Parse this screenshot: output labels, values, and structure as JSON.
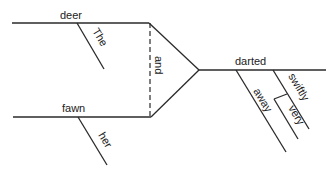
{
  "diagram": {
    "type": "sentence-diagram",
    "sentence_words": {
      "subject_1": "deer",
      "subject_1_modifier": "The",
      "subject_2": "fawn",
      "subject_2_modifier": "her",
      "conjunction": "and",
      "verb": "darted",
      "adverb_1": "away",
      "adverb_2": "swiftly",
      "adverb_2_modifier": "very"
    }
  }
}
